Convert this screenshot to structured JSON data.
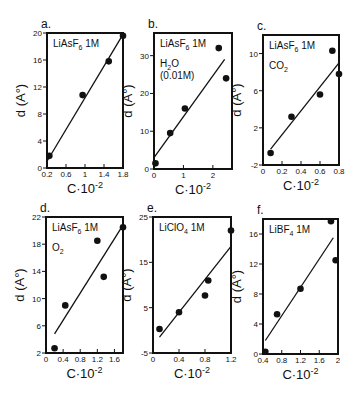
{
  "chart_data": [
    {
      "panel": "a.",
      "type": "scatter",
      "annotations": [
        "LiAsF6 1M"
      ],
      "xlabel": "C·10⁻²",
      "ylabel": "d (A°)",
      "xlim": [
        0.2,
        1.8
      ],
      "ylim": [
        0,
        20
      ],
      "xticks": [
        0.2,
        0.6,
        1,
        1.4,
        1.8
      ],
      "xtick_labels": [
        "0.2",
        "0.6",
        "1",
        "1.4",
        "1.8"
      ],
      "yticks": [
        0,
        4,
        8,
        12,
        16,
        20
      ],
      "ytick_labels": [
        "0",
        "4",
        "8",
        "12",
        "16",
        "20"
      ],
      "points": [
        [
          0.25,
          1.8
        ],
        [
          0.95,
          10.8
        ],
        [
          1.5,
          15.8
        ],
        [
          1.8,
          19.6
        ]
      ],
      "fit_line": [
        [
          0.2,
          1.0
        ],
        [
          1.8,
          19.8
        ]
      ],
      "frame": {
        "left": 47,
        "top": 33,
        "right": 123,
        "bottom": 168
      },
      "grid": false
    },
    {
      "panel": "b.",
      "type": "scatter",
      "annotations": [
        "LiAsF6 1M",
        "H2O",
        "(0.01M)"
      ],
      "xlabel": "C·10⁻²",
      "ylabel": "d (A°)",
      "xlim": [
        0,
        2.65
      ],
      "ylim": [
        0,
        36
      ],
      "xticks": [
        0,
        1,
        2
      ],
      "xtick_labels": [
        "0",
        "1",
        "2"
      ],
      "yticks": [
        0,
        10,
        20,
        30
      ],
      "ytick_labels": [
        "0",
        "10",
        "20",
        "30"
      ],
      "points": [
        [
          0.05,
          1.5
        ],
        [
          0.55,
          9.5
        ],
        [
          1.05,
          16
        ],
        [
          2.2,
          32
        ],
        [
          2.45,
          24
        ]
      ],
      "fit_line": [
        [
          0.0,
          3.0
        ],
        [
          2.4,
          29.0
        ]
      ],
      "frame": {
        "left": 154,
        "top": 33,
        "right": 232,
        "bottom": 169
      },
      "grid": false
    },
    {
      "panel": "c.",
      "type": "scatter",
      "annotations": [
        "LiAsF6 1M",
        "CO2"
      ],
      "xlabel": "C·10⁻²",
      "ylabel": "d (A°)",
      "xlim": [
        0,
        0.8
      ],
      "ylim": [
        -2,
        12
      ],
      "xticks": [
        0,
        0.2,
        0.4,
        0.6,
        0.8
      ],
      "xtick_labels": [
        "0",
        "0.2",
        "0.4",
        "0.6",
        "0.8"
      ],
      "yticks": [
        -2,
        2,
        6,
        10
      ],
      "ytick_labels": [
        "-2",
        "2",
        "6",
        "10"
      ],
      "points": [
        [
          0.08,
          -0.7
        ],
        [
          0.3,
          3.2
        ],
        [
          0.6,
          5.6
        ],
        [
          0.73,
          10.3
        ],
        [
          0.8,
          7.8
        ]
      ],
      "fit_line": [
        [
          0.08,
          -0.3
        ],
        [
          0.8,
          9.0
        ]
      ],
      "frame": {
        "left": 263,
        "top": 35,
        "right": 339,
        "bottom": 165
      },
      "grid": false
    },
    {
      "panel": "d.",
      "type": "scatter",
      "annotations": [
        "LiAsF6 1M",
        "O2"
      ],
      "xlabel": "C·10⁻²",
      "ylabel": "d (A°)",
      "xlim": [
        0,
        1.8
      ],
      "ylim": [
        2,
        22
      ],
      "xticks": [
        0,
        0.4,
        0.8,
        1.2,
        1.6
      ],
      "xtick_labels": [
        "0",
        "0.4",
        "0.8",
        "1.2",
        "1.6"
      ],
      "yticks": [
        2,
        6,
        10,
        14,
        18,
        22
      ],
      "ytick_labels": [
        "2",
        "6",
        "10",
        "14",
        "18",
        "22"
      ],
      "points": [
        [
          0.2,
          2.7
        ],
        [
          0.45,
          9.0
        ],
        [
          1.2,
          18.5
        ],
        [
          1.35,
          13.2
        ],
        [
          1.8,
          20.5
        ]
      ],
      "fit_line": [
        [
          0.2,
          4.8
        ],
        [
          1.8,
          20.8
        ]
      ],
      "frame": {
        "left": 46,
        "top": 217,
        "right": 123,
        "bottom": 353
      },
      "grid": false
    },
    {
      "panel": "e.",
      "type": "scatter",
      "annotations": [
        "LiClO4 1M"
      ],
      "xlabel": "C·10⁻²",
      "ylabel": "d (A°)",
      "xlim": [
        0,
        1.2
      ],
      "ylim": [
        -5,
        25
      ],
      "xticks": [
        0,
        0.4,
        0.8,
        1.2
      ],
      "xtick_labels": [
        "0",
        "0.4",
        "0.8",
        "1.2"
      ],
      "yticks": [
        -5,
        5,
        15,
        25
      ],
      "ytick_labels": [
        "-5",
        "5",
        "15",
        "25"
      ],
      "points": [
        [
          0.1,
          0.3
        ],
        [
          0.4,
          4.0
        ],
        [
          0.8,
          7.7
        ],
        [
          0.85,
          11.0
        ],
        [
          1.2,
          22.0
        ]
      ],
      "fit_line": [
        [
          0.1,
          -1.5
        ],
        [
          1.2,
          18.5
        ]
      ],
      "frame": {
        "left": 153,
        "top": 217,
        "right": 231,
        "bottom": 353
      },
      "grid": false
    },
    {
      "panel": "f.",
      "type": "scatter",
      "annotations": [
        "LiBF4 1M"
      ],
      "xlabel": "C·10⁻²",
      "ylabel": "d (A°)",
      "xlim": [
        0.4,
        2.0
      ],
      "ylim": [
        0,
        18
      ],
      "xticks": [
        0.4,
        0.8,
        1.2,
        1.6,
        2
      ],
      "xtick_labels": [
        "0.4",
        "0.8",
        "1.2",
        "1.6",
        "2"
      ],
      "yticks": [
        0,
        4,
        8,
        12,
        16
      ],
      "ytick_labels": [
        "0",
        "4",
        "8",
        "12",
        "16"
      ],
      "points": [
        [
          0.45,
          0.3
        ],
        [
          0.7,
          5.3
        ],
        [
          1.2,
          8.7
        ],
        [
          1.85,
          17.7
        ],
        [
          1.95,
          12.5
        ]
      ],
      "fit_line": [
        [
          0.45,
          1.8
        ],
        [
          1.9,
          15.5
        ]
      ],
      "frame": {
        "left": 263,
        "top": 219,
        "right": 338,
        "bottom": 354
      },
      "grid": false
    }
  ],
  "colors": {
    "ink": "#111111",
    "background": "#ffffff"
  }
}
